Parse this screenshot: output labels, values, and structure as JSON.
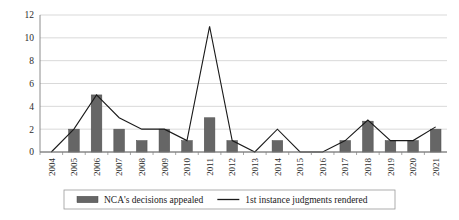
{
  "chart_data": {
    "type": "bar",
    "title": "",
    "subtitle": "",
    "xlabel": "",
    "ylabel": "",
    "ylim": [
      0,
      12
    ],
    "yticks": [
      0,
      2,
      4,
      6,
      8,
      10,
      12
    ],
    "ytick_labels": [
      "0",
      "2",
      "4",
      "6",
      "8",
      "10",
      "12"
    ],
    "grid": true,
    "grid_axis": "y",
    "legend_position": "bottom",
    "legend_boxed": true,
    "categories": [
      "2004",
      "2005",
      "2006",
      "2007",
      "2008",
      "2009",
      "2010",
      "2011",
      "2012",
      "2013",
      "2014",
      "2015",
      "2016",
      "2017",
      "2018",
      "2019",
      "2020",
      "2021"
    ],
    "series": [
      {
        "name": "NCA's decisions appealed",
        "type": "bar",
        "color": "#666666",
        "values": [
          0,
          2,
          5,
          2,
          1,
          2,
          1,
          3,
          1,
          0,
          1,
          0,
          0,
          1,
          2.7,
          1,
          1,
          2
        ]
      },
      {
        "name": "1st instance judgments rendered",
        "type": "line",
        "color": "#1a1a1a",
        "values": [
          0,
          2,
          5,
          3,
          2,
          2,
          1,
          11,
          1,
          0,
          2,
          0,
          0,
          1,
          2.8,
          1,
          1,
          2.2
        ]
      }
    ]
  },
  "legend": {
    "entries": [
      {
        "label": "NCA's decisions appealed",
        "marker": "bar-swatch"
      },
      {
        "label": "1st instance judgments rendered",
        "marker": "line-swatch"
      }
    ]
  },
  "axes": {
    "y_tick_labels": [
      "12",
      "10",
      "8",
      "6",
      "4",
      "2",
      "0"
    ],
    "x_tick_labels": [
      "2004",
      "2005",
      "2006",
      "2007",
      "2008",
      "2009",
      "2010",
      "2011",
      "2012",
      "2013",
      "2014",
      "2015",
      "2016",
      "2017",
      "2018",
      "2019",
      "2020",
      "2021"
    ]
  },
  "colors": {
    "bar": "#666666",
    "line": "#1a1a1a",
    "grid": "#c8c8c8",
    "axis": "#808080",
    "background": "#ffffff",
    "legend_border": "#9a9a9a"
  }
}
